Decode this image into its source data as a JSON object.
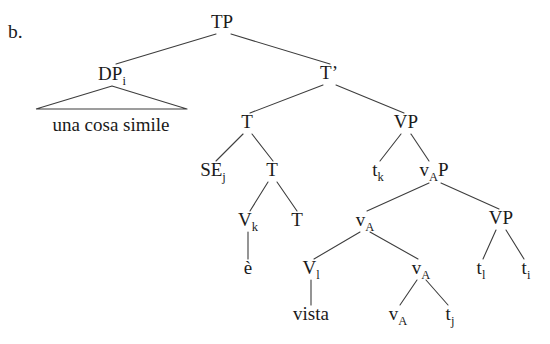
{
  "figure": {
    "item_label": "b.",
    "caption_text": "una cosa simile",
    "ink_color": "#1a1a1a",
    "line_color": "#3d3d3d",
    "background_color": "#ffffff"
  },
  "nodes": [
    {
      "id": "TP",
      "base": "TP",
      "sub": "",
      "x": 222,
      "y": 28,
      "kind": "phrase"
    },
    {
      "id": "DPi",
      "base": "DP",
      "sub": "i",
      "x": 112,
      "y": 80,
      "kind": "phrase"
    },
    {
      "id": "Tbar",
      "base": "T’",
      "sub": "",
      "x": 329,
      "y": 79,
      "kind": "phrase"
    },
    {
      "id": "T1",
      "base": "T",
      "sub": "",
      "x": 247,
      "y": 128,
      "kind": "head"
    },
    {
      "id": "VP1",
      "base": "VP",
      "sub": "",
      "x": 406,
      "y": 128,
      "kind": "phrase"
    },
    {
      "id": "SEj",
      "base": "SE",
      "sub": "j",
      "x": 213,
      "y": 176,
      "kind": "head"
    },
    {
      "id": "T2",
      "base": "T",
      "sub": "",
      "x": 272,
      "y": 176,
      "kind": "head"
    },
    {
      "id": "tk",
      "base": "t",
      "sub": "k",
      "x": 378,
      "y": 176,
      "kind": "trace"
    },
    {
      "id": "vAP",
      "base": "v",
      "sub": "A",
      "suffix": "P",
      "x": 434,
      "y": 176,
      "kind": "phrase"
    },
    {
      "id": "Vk",
      "base": "V",
      "sub": "k",
      "x": 248,
      "y": 226,
      "kind": "head"
    },
    {
      "id": "T3",
      "base": "T",
      "sub": "",
      "x": 297,
      "y": 226,
      "kind": "head"
    },
    {
      "id": "vA1",
      "base": "v",
      "sub": "A",
      "x": 365,
      "y": 226,
      "kind": "head"
    },
    {
      "id": "VP2",
      "base": "VP",
      "sub": "",
      "x": 501,
      "y": 224,
      "kind": "phrase"
    },
    {
      "id": "e",
      "base": "è",
      "sub": "",
      "x": 248,
      "y": 274,
      "kind": "lexical"
    },
    {
      "id": "Vl",
      "base": "V",
      "sub": "l",
      "x": 311,
      "y": 274,
      "kind": "head"
    },
    {
      "id": "vA2",
      "base": "v",
      "sub": "A",
      "x": 421,
      "y": 274,
      "kind": "head"
    },
    {
      "id": "tl",
      "base": "t",
      "sub": "l",
      "x": 481,
      "y": 274,
      "kind": "trace"
    },
    {
      "id": "ti",
      "base": "t",
      "sub": "i",
      "x": 526,
      "y": 274,
      "kind": "trace"
    },
    {
      "id": "vista",
      "base": "vista",
      "sub": "",
      "x": 311,
      "y": 320,
      "kind": "lexical"
    },
    {
      "id": "vA3",
      "base": "v",
      "sub": "A",
      "x": 398,
      "y": 320,
      "kind": "head"
    },
    {
      "id": "tj",
      "base": "t",
      "sub": "j",
      "x": 450,
      "y": 320,
      "kind": "trace"
    }
  ],
  "edges": [
    {
      "from": "TP",
      "to": "DPi",
      "x1": 216,
      "y1": 34,
      "x2": 116,
      "y2": 64
    },
    {
      "from": "TP",
      "to": "Tbar",
      "x1": 231,
      "y1": 34,
      "x2": 330,
      "y2": 64
    },
    {
      "from": "Tbar",
      "to": "T1",
      "x1": 323,
      "y1": 85,
      "x2": 250,
      "y2": 113
    },
    {
      "from": "Tbar",
      "to": "VP1",
      "x1": 336,
      "y1": 85,
      "x2": 404,
      "y2": 113
    },
    {
      "from": "T1",
      "to": "SEj",
      "x1": 243,
      "y1": 134,
      "x2": 216,
      "y2": 161
    },
    {
      "from": "T1",
      "to": "T2",
      "x1": 252,
      "y1": 134,
      "x2": 273,
      "y2": 161
    },
    {
      "from": "VP1",
      "to": "tk",
      "x1": 401,
      "y1": 134,
      "x2": 380,
      "y2": 161
    },
    {
      "from": "VP1",
      "to": "vAP",
      "x1": 411,
      "y1": 134,
      "x2": 429,
      "y2": 161
    },
    {
      "from": "T2",
      "to": "Vk",
      "x1": 268,
      "y1": 182,
      "x2": 250,
      "y2": 211
    },
    {
      "from": "T2",
      "to": "T3",
      "x1": 277,
      "y1": 182,
      "x2": 297,
      "y2": 211
    },
    {
      "from": "vAP",
      "to": "vA1",
      "x1": 429,
      "y1": 183,
      "x2": 367,
      "y2": 211
    },
    {
      "from": "vAP",
      "to": "VP2",
      "x1": 441,
      "y1": 183,
      "x2": 499,
      "y2": 209
    },
    {
      "from": "Vk",
      "to": "e",
      "x1": 248,
      "y1": 232,
      "x2": 248,
      "y2": 259
    },
    {
      "from": "vA1",
      "to": "Vl",
      "x1": 360,
      "y1": 232,
      "x2": 314,
      "y2": 259
    },
    {
      "from": "vA1",
      "to": "vA2",
      "x1": 370,
      "y1": 232,
      "x2": 418,
      "y2": 259
    },
    {
      "from": "VP2",
      "to": "tl",
      "x1": 496,
      "y1": 230,
      "x2": 483,
      "y2": 259
    },
    {
      "from": "VP2",
      "to": "ti",
      "x1": 506,
      "y1": 230,
      "x2": 524,
      "y2": 259
    },
    {
      "from": "Vl",
      "to": "vista",
      "x1": 311,
      "y1": 280,
      "x2": 311,
      "y2": 305
    },
    {
      "from": "vA2",
      "to": "vA3",
      "x1": 417,
      "y1": 280,
      "x2": 400,
      "y2": 305
    },
    {
      "from": "vA2",
      "to": "tj",
      "x1": 426,
      "y1": 280,
      "x2": 448,
      "y2": 305
    }
  ],
  "triangle": {
    "apex_x": 112,
    "apex_y": 86,
    "left_x": 36,
    "right_x": 187,
    "base_y": 109,
    "label": "una cosa simile",
    "label_x": 111,
    "label_y": 131
  },
  "item": {
    "x": 8,
    "y": 38
  }
}
